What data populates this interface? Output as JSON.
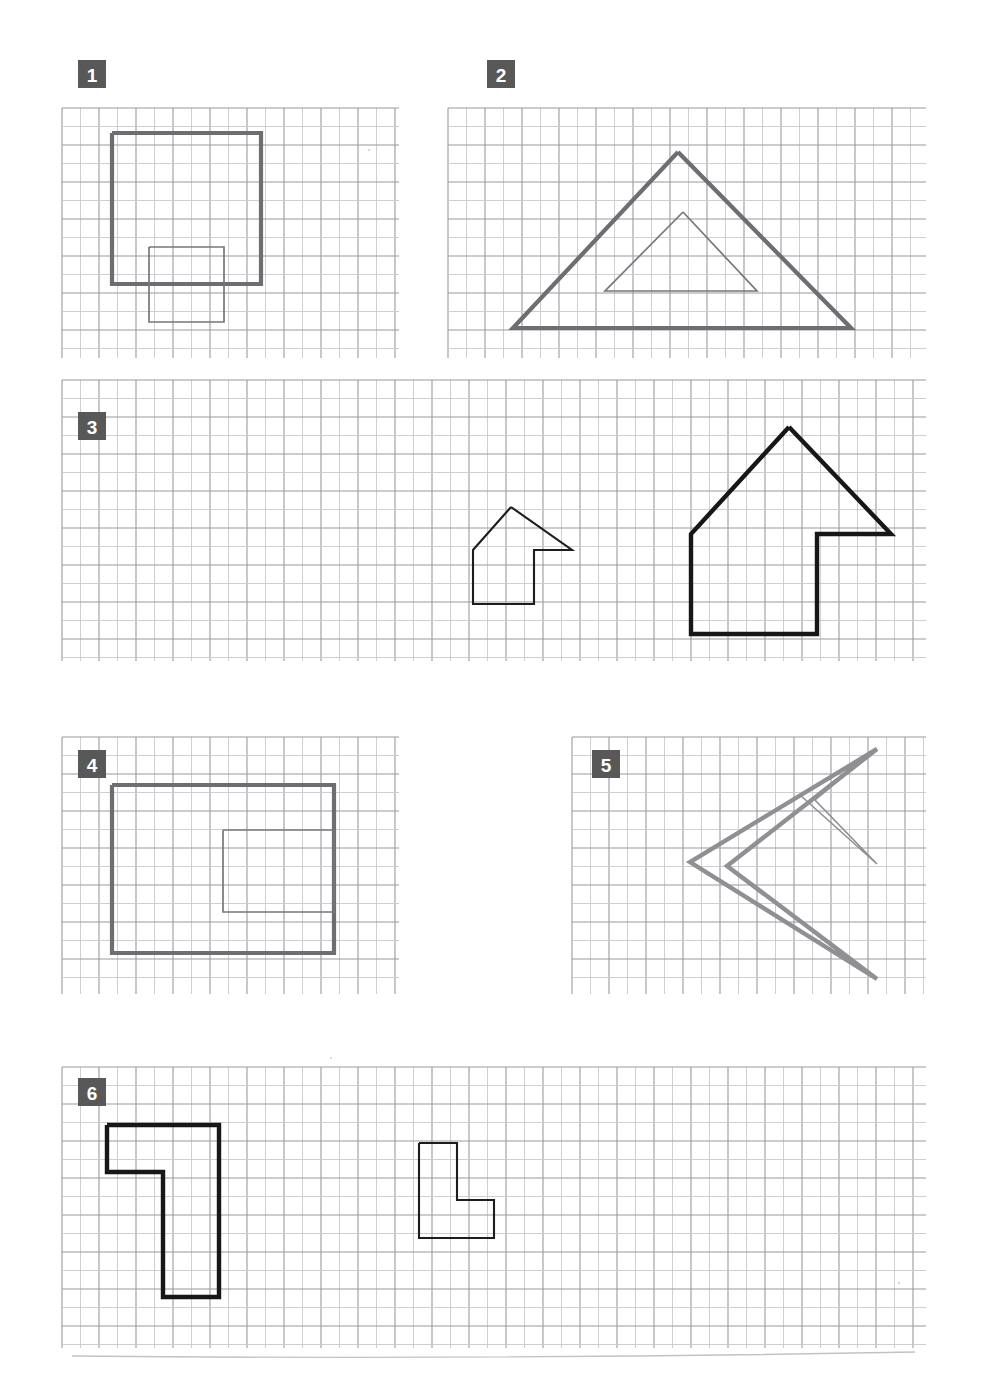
{
  "page": {
    "width": 983,
    "height": 1388,
    "background": "#ffffff",
    "paper": "graph-paper"
  },
  "style": {
    "grid_minor_color": "#c9c9cd",
    "grid_major_color": "#9a9aa0",
    "shape_gray": "#6d6d72",
    "shape_gray_light": "#8f8f94",
    "shape_black": "#17171a",
    "badge_fill": "#585858",
    "badge_text_color": "#ffffff",
    "grid_cell_px": 37
  },
  "exercises": [
    {
      "number": "1",
      "badge_label": "1",
      "grid": {
        "x": 62,
        "y": 108,
        "width": 337,
        "height": 250,
        "cols": 9,
        "rows": 7
      },
      "badge": {
        "x": 78,
        "y": 60,
        "size": 28
      },
      "shapes": [
        {
          "name": "large-square",
          "kind": "square",
          "stroke": "thick-gray",
          "points": "112,133 261,133 261,284 112,284 112,133"
        },
        {
          "name": "small-square",
          "kind": "square",
          "stroke": "thin-gray",
          "points": "149,247 224,247 224,322 149,322 149,247"
        }
      ]
    },
    {
      "number": "2",
      "badge_label": "2",
      "grid": {
        "x": 448,
        "y": 108,
        "width": 478,
        "height": 250,
        "cols": 13,
        "rows": 7
      },
      "badge": {
        "x": 487,
        "y": 60,
        "size": 28
      },
      "shapes": [
        {
          "name": "large-triangle",
          "kind": "triangle",
          "stroke": "thick-gray",
          "points": "678,152 851,328 513,328 678,152"
        },
        {
          "name": "small-triangle",
          "kind": "triangle",
          "stroke": "thin-gray",
          "points": "683,212 757,291 605,291 683,212"
        }
      ]
    },
    {
      "number": "3",
      "badge_label": "3",
      "grid": {
        "x": 62,
        "y": 380,
        "width": 864,
        "height": 281,
        "cols": 23,
        "rows": 8
      },
      "badge": {
        "x": 78,
        "y": 412,
        "size": 28
      },
      "shapes": [
        {
          "name": "small-arrow-house",
          "kind": "arrow-house",
          "stroke": "thin-black",
          "points": "511,507 572,550 534,550 534,604 473,604 473,550 511,507"
        },
        {
          "name": "large-arrow-house",
          "kind": "arrow-house",
          "stroke": "thick-black",
          "points": "789,427 891,534 817,534 817,634 691,634 691,534 789,427"
        }
      ]
    },
    {
      "number": "4",
      "badge_label": "4",
      "grid": {
        "x": 62,
        "y": 737,
        "width": 337,
        "height": 257,
        "cols": 9,
        "rows": 7
      },
      "badge": {
        "x": 78,
        "y": 750,
        "size": 28
      },
      "shapes": [
        {
          "name": "outer-rectangle",
          "kind": "rectangle",
          "stroke": "thick-gray",
          "points": "112,785 334,785 334,953 112,953 112,785"
        },
        {
          "name": "inner-rectangle",
          "kind": "rectangle",
          "stroke": "thin-gray",
          "points": "223,830 334,830 334,912 223,912 223,830"
        }
      ]
    },
    {
      "number": "5",
      "badge_label": "5",
      "grid": {
        "x": 572,
        "y": 737,
        "width": 354,
        "height": 257,
        "cols": 9,
        "rows": 7
      },
      "badge": {
        "x": 592,
        "y": 750,
        "size": 28
      },
      "shapes": [
        {
          "name": "large-arrowhead",
          "kind": "arrowhead",
          "stroke": "arrow-gray",
          "points": "877,749 690,862 877,979 727,866 877,749"
        },
        {
          "name": "small-arrowhead",
          "kind": "arrowhead",
          "stroke": "arrow-thin",
          "points": "877,749 800,795 877,864 815,800 877,749"
        }
      ]
    },
    {
      "number": "6",
      "badge_label": "6",
      "grid": {
        "x": 62,
        "y": 1067,
        "width": 864,
        "height": 281,
        "cols": 23,
        "rows": 8
      },
      "badge": {
        "x": 78,
        "y": 1078,
        "size": 28
      },
      "shapes": [
        {
          "name": "large-L-shape",
          "kind": "l-shape",
          "stroke": "thick-black",
          "points": "107,1125 219,1125 219,1297 163,1297 163,1172 107,1172 107,1125"
        },
        {
          "name": "small-L-shape",
          "kind": "l-shape",
          "stroke": "thin-black",
          "points": "419,1143 457,1143 457,1200 494,1200 494,1238 419,1238 419,1143"
        }
      ]
    }
  ],
  "footer": {
    "rule_label": "bottom-rule",
    "y": 1355
  }
}
